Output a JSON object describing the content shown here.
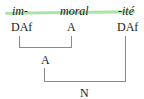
{
  "diagram": {
    "type": "morphological-tree",
    "highlight_color": "#8fd88a",
    "morphemes": [
      {
        "form": "im-",
        "category": "DAf"
      },
      {
        "form": "moral",
        "category": "A"
      },
      {
        "form": "-ité",
        "category": "DAf"
      }
    ],
    "nodes": [
      {
        "label": "A",
        "children": [
          "im-",
          "moral"
        ]
      },
      {
        "label": "N",
        "children": [
          "A",
          "-ité"
        ]
      }
    ]
  }
}
